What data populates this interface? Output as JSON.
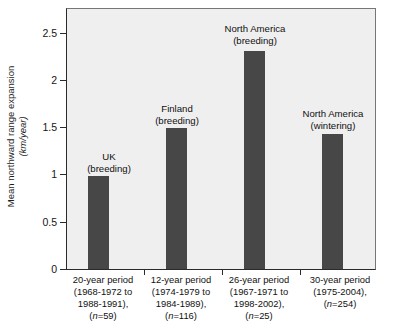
{
  "chart_data": {
    "type": "bar",
    "title": "",
    "xlabel": "",
    "ylabel": "Mean northward range expansion",
    "ylabel_unit": "(km/year)",
    "ylim": [
      0,
      2.75
    ],
    "yticks": [
      0,
      0.5,
      1,
      1.5,
      2,
      2.5
    ],
    "ytick_labels": [
      "0",
      "0.5",
      "1",
      "1.5",
      "2",
      "2.5"
    ],
    "grid": false,
    "legend": "none",
    "bar_color": "#474747",
    "plot_background": "#efefef",
    "categories": [
      "20-year period (1968-1972 to 1988-1991), (n=59)",
      "12-year period (1974-1979 to 1984-1989), (n=116)",
      "26-year period (1967-1971 to 1998-2002), (n=25)",
      "30-year period (1975-2004), (n=254)"
    ],
    "values": [
      0.98,
      1.49,
      2.31,
      1.43
    ],
    "annotations": [
      "UK (breeding)",
      "Finland (breeding)",
      "North America (breeding)",
      "North America (wintering)"
    ]
  },
  "bars": [
    {
      "annot_line1": "UK",
      "annot_line2": "(breeding)",
      "value": 0.98,
      "xlabel_line1": "20-year period",
      "xlabel_line2": "(1968-1972 to",
      "xlabel_line3": "1988-1991),",
      "xlabel_n": "n",
      "xlabel_n_val": "=59)"
    },
    {
      "annot_line1": "Finland",
      "annot_line2": "(breeding)",
      "value": 1.49,
      "xlabel_line1": "12-year period",
      "xlabel_line2": "(1974-1979 to",
      "xlabel_line3": "1984-1989),",
      "xlabel_n": "n",
      "xlabel_n_val": "=116)"
    },
    {
      "annot_line1": "North America",
      "annot_line2": "(breeding)",
      "value": 2.31,
      "xlabel_line1": "26-year period",
      "xlabel_line2": "(1967-1971 to",
      "xlabel_line3": "1998-2002),",
      "xlabel_n": "n",
      "xlabel_n_val": "=25)"
    },
    {
      "annot_line1": "North America",
      "annot_line2": "(wintering)",
      "value": 1.43,
      "xlabel_line1": "30-year period",
      "xlabel_line2": "(1975-2004),",
      "xlabel_line3": "",
      "xlabel_n": "n",
      "xlabel_n_val": "=254)"
    }
  ],
  "yaxis": {
    "tick_labels": [
      "2.5",
      "2",
      "1.5",
      "1",
      "0.5",
      "0"
    ],
    "title": "Mean northward range expansion",
    "unit": "(km/year)"
  }
}
